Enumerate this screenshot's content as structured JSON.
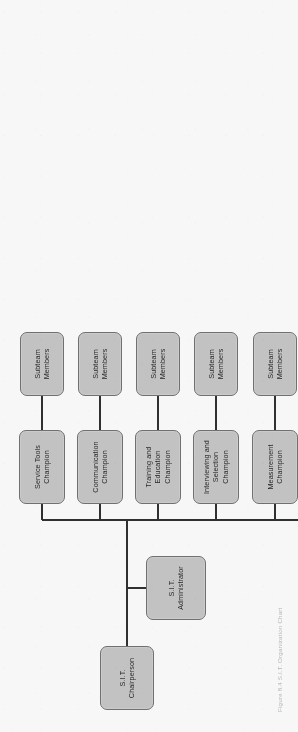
{
  "figure": {
    "type": "organization-chart",
    "orientation": "rotated-90-ccw",
    "caption": "Figure 8.4  S.I.T. Organization Chart",
    "colors": {
      "box_fill": "#c6c6c6",
      "box_border": "#6f6f6f",
      "connector": "#2b2b2b",
      "background": "#ffffff",
      "text": "#1d1d1d"
    }
  },
  "root": {
    "label": "S.I.T.\nChairperson",
    "line1": "S.I.T.",
    "line2": "Chairperson"
  },
  "administrator": {
    "label": "S.I.T.\nAdministrator",
    "line1": "S.I.T.",
    "line2": "Administrator"
  },
  "subteam_label": {
    "line1": "Subteam",
    "line2": "Members"
  },
  "champions": [
    {
      "id": "service-tools",
      "line1": "Service Tools",
      "line2": "Champion",
      "line3": "",
      "subteam": {
        "line1": "Subteam",
        "line2": "Members"
      }
    },
    {
      "id": "communication",
      "line1": "Communication",
      "line2": "Champion",
      "line3": "",
      "subteam": {
        "line1": "Subteam",
        "line2": "Members"
      }
    },
    {
      "id": "training-education",
      "line1": "Training and",
      "line2": "Education",
      "line3": "Champion",
      "subteam": {
        "line1": "Subteam",
        "line2": "Members"
      }
    },
    {
      "id": "interviewing-selection",
      "line1": "Interviewing and",
      "line2": "Selection",
      "line3": "Champion",
      "subteam": {
        "line1": "Subteam",
        "line2": "Members"
      }
    },
    {
      "id": "measurement",
      "line1": "Measurement",
      "line2": "Champion",
      "line3": "",
      "subteam": {
        "line1": "Subteam",
        "line2": "Members"
      }
    },
    {
      "id": "recognition",
      "line1": "Recognition",
      "line2": "Champion",
      "line3": "",
      "subteam": {
        "line1": "Subteam",
        "line2": "Members"
      }
    },
    {
      "id": "service-obstacle-system",
      "line1": "Service Obstacle",
      "line2": "System",
      "line3": "Champion",
      "subteam": {
        "line1": "Subteam",
        "line2": "Members"
      }
    },
    {
      "id": "accountability",
      "line1": "Accountability",
      "line2": "Champion",
      "line3": "",
      "subteam": {
        "line1": "Subteam",
        "line2": "Members"
      }
    }
  ]
}
